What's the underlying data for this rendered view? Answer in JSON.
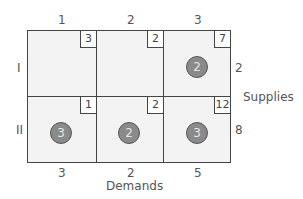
{
  "diagram": {
    "type": "transportation-tableau",
    "column_headers": [
      "1",
      "2",
      "3"
    ],
    "row_headers": [
      "I",
      "II"
    ],
    "costs": [
      [
        "3",
        "2",
        "7"
      ],
      [
        "1",
        "2",
        "12"
      ]
    ],
    "allocations": [
      [
        null,
        null,
        "2"
      ],
      [
        "3",
        "2",
        "3"
      ]
    ],
    "supplies": [
      "2",
      "8"
    ],
    "supplies_label": "Supplies",
    "demands": [
      "3",
      "2",
      "5"
    ],
    "demands_label": "Demands",
    "colors": {
      "grid_line": "#444444",
      "cell_fill": "#f3f3f3",
      "allocation_circle": "#8a8a8a"
    }
  }
}
